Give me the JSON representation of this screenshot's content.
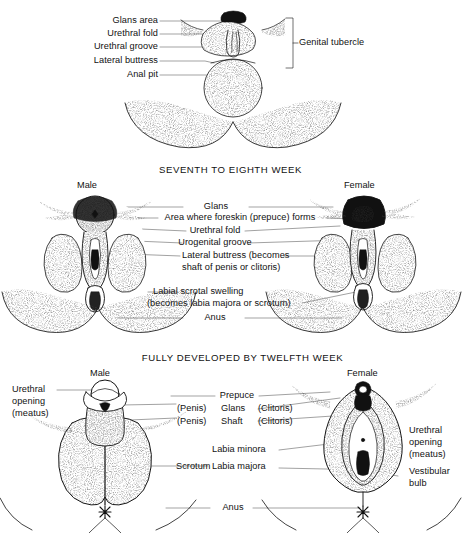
{
  "figure": {
    "type": "anatomical-diagram",
    "background_color": "#ffffff",
    "ink_color": "#111111"
  },
  "panels": [
    {
      "id": "panel-undifferentiated",
      "title": "",
      "left_labels": [
        "Glans area",
        "Urethral fold",
        "Urethral groove",
        "Lateral buttress",
        "Anal pit"
      ],
      "bracket_label": "Genital tubercle"
    },
    {
      "id": "panel-seventh-eighth-week",
      "title": "SEVENTH TO EIGHTH WEEK",
      "sex_left": "Male",
      "sex_right": "Female",
      "center_labels": [
        "Glans",
        "Area where foreskin (prepuce) forms",
        "Urethral fold",
        "Urogenital groove",
        "Lateral buttress (becomes",
        "shaft of penis or clitoris)",
        "Labial scrotal swelling",
        "(becomes labia majora or scrotum)",
        "Anus"
      ]
    },
    {
      "id": "panel-twelfth-week",
      "title": "FULLY DEVELOPED BY TWELFTH WEEK",
      "sex_left": "Male",
      "sex_right": "Female",
      "left_labels": [
        "Urethral",
        "opening",
        "(meatus)"
      ],
      "center_rows": [
        {
          "left": "",
          "middle": "Prepuce",
          "right": ""
        },
        {
          "left": "(Penis)",
          "middle": "Glans",
          "right": "(Clitoris)"
        },
        {
          "left": "(Penis)",
          "middle": "Shaft",
          "right": "(Clitoris)"
        }
      ],
      "center_labels": [
        "Labia minora",
        "Scrotum",
        "Labia majora",
        "Anus"
      ],
      "right_labels": [
        "Urethral",
        "opening",
        "(meatus)",
        "Vestibular",
        "bulb"
      ]
    }
  ]
}
